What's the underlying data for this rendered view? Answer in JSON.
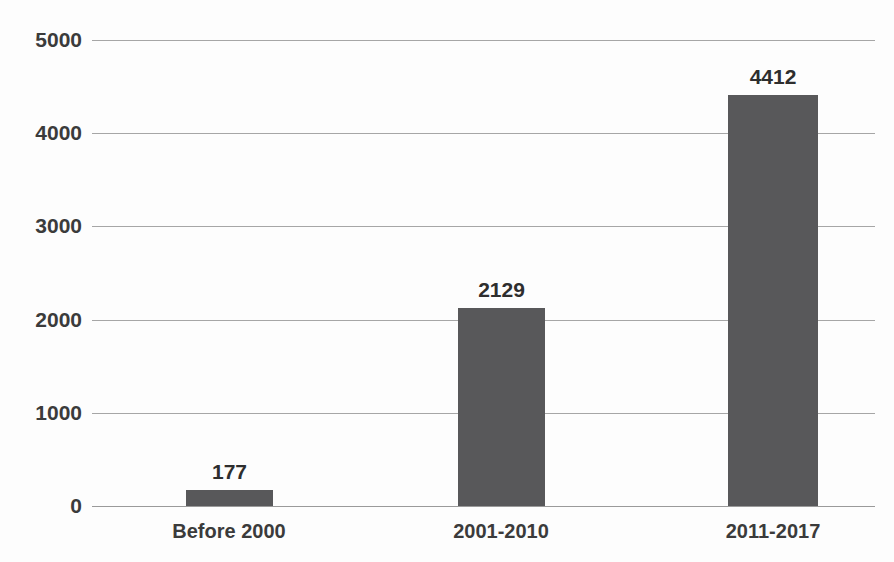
{
  "chart_data": {
    "type": "bar",
    "title": "",
    "subtitle": "",
    "xlabel": "",
    "ylabel": "",
    "categories": [
      "Before 2000",
      "2001-2010",
      "2011-2017"
    ],
    "values": [
      177,
      2129,
      4412
    ],
    "value_labels": [
      "177",
      "2129",
      "4412"
    ],
    "series": [
      {
        "name": "",
        "values": [
          177,
          2129,
          4412
        ]
      }
    ],
    "ylim": [
      0,
      5000
    ],
    "yticks": [
      0,
      1000,
      2000,
      3000,
      4000,
      5000
    ],
    "ytick_labels": [
      "0",
      "1000",
      "2000",
      "3000",
      "4000",
      "5000"
    ],
    "grid": true,
    "grid_axis": "y",
    "legend": false,
    "legend_position": "none",
    "bar_color": "#58585a",
    "gridline_color": "#a6a6a6",
    "background_color": "#fdfdfd",
    "text_color": "#3b3b3b",
    "data_label_color": "#2e2e2e"
  }
}
